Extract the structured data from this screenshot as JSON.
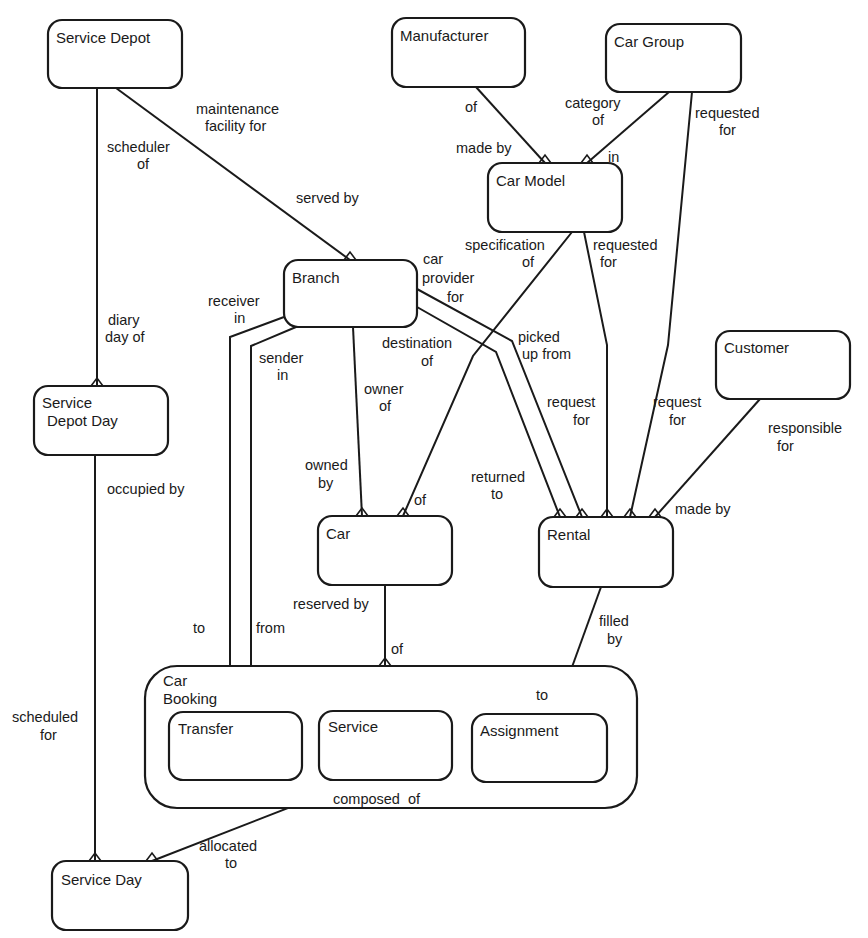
{
  "diagram": {
    "type": "entity-relationship",
    "entities": [
      {
        "id": "service_depot",
        "label": "Service Depot"
      },
      {
        "id": "manufacturer",
        "label": "Manufacturer"
      },
      {
        "id": "car_group",
        "label": "Car Group"
      },
      {
        "id": "car_model",
        "label": "Car Model"
      },
      {
        "id": "branch",
        "label": "Branch"
      },
      {
        "id": "customer",
        "label": "Customer"
      },
      {
        "id": "service_depot_day",
        "label_line1": "Service",
        "label_line2": "Depot Day"
      },
      {
        "id": "car",
        "label": "Car"
      },
      {
        "id": "rental",
        "label": "Rental"
      },
      {
        "id": "car_booking",
        "label_line1": "Car",
        "label_line2": "Booking"
      },
      {
        "id": "transfer",
        "label": "Transfer"
      },
      {
        "id": "service",
        "label": "Service"
      },
      {
        "id": "assignment",
        "label": "Assignment"
      },
      {
        "id": "service_day",
        "label": "Service Day"
      }
    ],
    "relationship_labels": {
      "maintenance_facility_for": [
        "maintenance",
        "facility  for"
      ],
      "served_by": "served by",
      "scheduler_of": [
        "scheduler",
        "of"
      ],
      "diary_day_of": [
        "diary",
        "day of"
      ],
      "manufacturer_of": "of",
      "made_by": "made by",
      "category_of": [
        "category",
        "of"
      ],
      "in": "in",
      "group_requested_for": [
        "requested",
        "for"
      ],
      "specification_of": [
        "specification",
        "of"
      ],
      "model_requested_for": [
        "requested",
        "for"
      ],
      "car_provider_for": [
        "car",
        "provider",
        "for"
      ],
      "picked_up_from": [
        "picked",
        "up from"
      ],
      "receiver_in": [
        "receiver",
        "in"
      ],
      "sender_in": [
        "sender",
        "in"
      ],
      "destination_of": [
        "destination",
        "of"
      ],
      "owner_of": [
        "owner",
        "of"
      ],
      "owned_by": [
        "owned",
        "by"
      ],
      "car_of": "of",
      "returned_to": [
        "returned",
        "to"
      ],
      "request_for_model": [
        "request",
        "for"
      ],
      "request_for_group": [
        "request",
        "for"
      ],
      "responsible_for": [
        "responsible",
        "for"
      ],
      "rental_made_by": "made by",
      "occupied_by": "occupied by",
      "reserved_by": "reserved by",
      "booking_of": "of",
      "filled_by": [
        "filled",
        "by"
      ],
      "assignment_to": "to",
      "transfer_to": "to",
      "transfer_from": "from",
      "scheduled_for": [
        "scheduled",
        "for"
      ],
      "composed_of": "composed  of",
      "allocated_to": [
        "allocated",
        "to"
      ]
    }
  }
}
